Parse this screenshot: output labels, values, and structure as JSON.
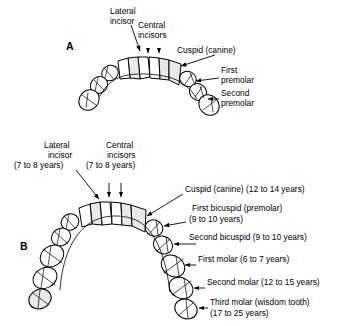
{
  "figure": {
    "background_color": "#ffffff",
    "ink_color": "#000000",
    "tooth_shade_color": "#e9e9e9"
  },
  "panels": [
    {
      "letter": "A",
      "description": "upper dental arch, unlabeled eruption ages",
      "labels": [
        {
          "id": "lateral-incisor",
          "lines": [
            "Lateral",
            "incisor"
          ]
        },
        {
          "id": "central-incisors",
          "lines": [
            "Central",
            "incisors"
          ]
        },
        {
          "id": "cuspid-canine",
          "lines": [
            "Cuspid (canine)"
          ]
        },
        {
          "id": "first-premolar",
          "lines": [
            "First",
            "premolar"
          ]
        },
        {
          "id": "second-premolar",
          "lines": [
            "Second",
            "premolar"
          ]
        }
      ]
    },
    {
      "letter": "B",
      "description": "lower dental arch with eruption ages",
      "labels": [
        {
          "id": "lateral-incisor",
          "lines": [
            "Lateral",
            "incisor",
            "(7 to 8 years)"
          ]
        },
        {
          "id": "central-incisors",
          "lines": [
            "Central",
            "incisors",
            "(7 to 8 years)"
          ]
        },
        {
          "id": "cuspid-canine",
          "lines": [
            "Cuspid (canine) (12 to 14 years)"
          ]
        },
        {
          "id": "first-bicuspid",
          "lines": [
            "First bicuspid (premolar)",
            "(9 to 10 years)"
          ]
        },
        {
          "id": "second-bicuspid",
          "lines": [
            "Second bicuspid (9 to 10 years)"
          ]
        },
        {
          "id": "first-molar",
          "lines": [
            "First molar (6 to 7 years)"
          ]
        },
        {
          "id": "second-molar",
          "lines": [
            "Second molar (12 to 15 years)"
          ]
        },
        {
          "id": "third-molar",
          "lines": [
            "Third molar (wisdom tooth)",
            "(17 to 25 years)"
          ]
        }
      ]
    }
  ],
  "text": {
    "a_lateral_1": "Lateral",
    "a_lateral_2": "incisor",
    "a_central_1": "Central",
    "a_central_2": "incisors",
    "a_cuspid_1": "Cuspid (canine)",
    "a_first_premolar_1": "First",
    "a_first_premolar_2": "premolar",
    "a_second_premolar_1": "Second",
    "a_second_premolar_2": "premolar",
    "a_letter": "A",
    "b_lateral_1": "Lateral",
    "b_lateral_2": "incisor",
    "b_lateral_3": "(7 to 8 years)",
    "b_central_1": "Central",
    "b_central_2": "incisors",
    "b_central_3": "(7 to 8 years)",
    "b_cuspid_1": "Cuspid (canine) (12 to 14 years)",
    "b_first_bicuspid_1": "First bicuspid (premolar)",
    "b_first_bicuspid_2": "(9 to 10 years)",
    "b_second_bicuspid_1": "Second bicuspid (9 to 10 years)",
    "b_first_molar_1": "First molar (6 to 7 years)",
    "b_second_molar_1": "Second molar (12 to 15 years)",
    "b_third_molar_1": "Third molar (wisdom tooth)",
    "b_third_molar_2": "(17 to 25 years)",
    "b_letter": "B"
  }
}
